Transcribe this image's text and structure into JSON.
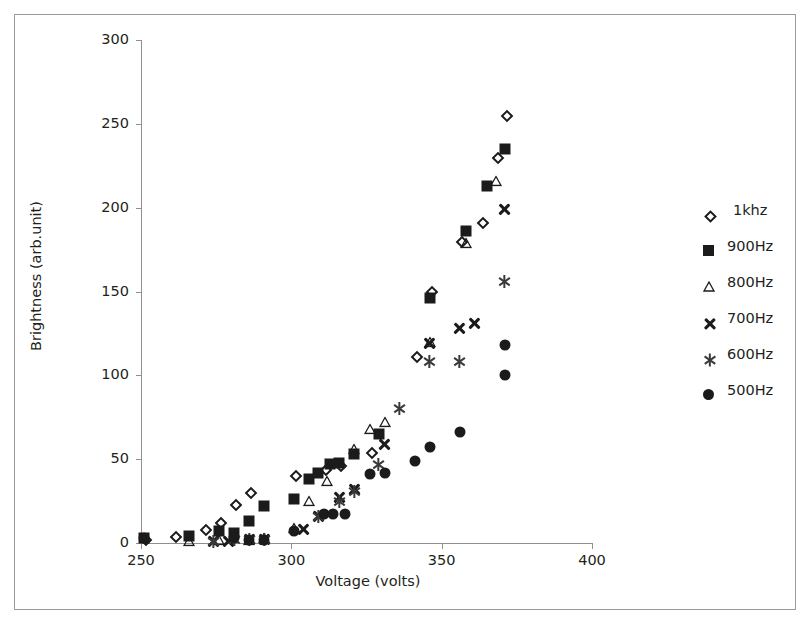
{
  "chart_data": {
    "type": "scatter",
    "title": "",
    "xlabel": "Voltage (volts)",
    "ylabel": "Brightness (arb.unit)",
    "xlim": [
      250,
      400
    ],
    "ylim": [
      0,
      300
    ],
    "xticks": [
      250,
      300,
      350,
      400
    ],
    "yticks": [
      0,
      50,
      100,
      150,
      200,
      250,
      300
    ],
    "grid": false,
    "legend_position": "right",
    "series": [
      {
        "name": "1khz",
        "marker": "open-diamond",
        "color": "#1b1b1b",
        "points": [
          [
            251,
            3
          ],
          [
            261,
            5
          ],
          [
            271,
            9
          ],
          [
            276,
            13
          ],
          [
            281,
            24
          ],
          [
            286,
            31
          ],
          [
            301,
            41
          ],
          [
            311,
            45
          ],
          [
            316,
            47
          ],
          [
            326,
            55
          ],
          [
            341,
            112
          ],
          [
            346,
            151
          ],
          [
            356,
            181
          ],
          [
            363,
            192
          ],
          [
            368,
            231
          ],
          [
            371,
            256
          ]
        ]
      },
      {
        "name": "900Hz",
        "marker": "filled-square",
        "color": "#1b1b1b",
        "points": [
          [
            251,
            3
          ],
          [
            266,
            4
          ],
          [
            276,
            7
          ],
          [
            281,
            6
          ],
          [
            286,
            13
          ],
          [
            291,
            22
          ],
          [
            301,
            26
          ],
          [
            306,
            38
          ],
          [
            309,
            42
          ],
          [
            313,
            47
          ],
          [
            316,
            48
          ],
          [
            321,
            53
          ],
          [
            329,
            65
          ],
          [
            346,
            146
          ],
          [
            358,
            186
          ],
          [
            365,
            213
          ],
          [
            371,
            235
          ]
        ]
      },
      {
        "name": "800Hz",
        "marker": "open-triangle",
        "color": "#1b1b1b",
        "points": [
          [
            266,
            1
          ],
          [
            276,
            2
          ],
          [
            286,
            2
          ],
          [
            291,
            3
          ],
          [
            301,
            9
          ],
          [
            306,
            25
          ],
          [
            312,
            37
          ],
          [
            321,
            56
          ],
          [
            326,
            68
          ],
          [
            331,
            72
          ],
          [
            346,
            120
          ],
          [
            358,
            179
          ],
          [
            368,
            216
          ]
        ]
      },
      {
        "name": "700Hz",
        "marker": "bold-x",
        "color": "#1b1b1b",
        "points": [
          [
            274,
            1
          ],
          [
            279,
            1
          ],
          [
            286,
            2
          ],
          [
            291,
            2
          ],
          [
            304,
            8
          ],
          [
            309,
            16
          ],
          [
            316,
            27
          ],
          [
            321,
            32
          ],
          [
            331,
            59
          ],
          [
            346,
            119
          ],
          [
            356,
            128
          ],
          [
            361,
            131
          ],
          [
            371,
            199
          ]
        ]
      },
      {
        "name": "600Hz",
        "marker": "asterisk",
        "color": "#3a3a3a",
        "points": [
          [
            274,
            1
          ],
          [
            281,
            2
          ],
          [
            286,
            2
          ],
          [
            291,
            2
          ],
          [
            309,
            16
          ],
          [
            316,
            25
          ],
          [
            321,
            31
          ],
          [
            329,
            47
          ],
          [
            336,
            80
          ],
          [
            346,
            108
          ],
          [
            356,
            108
          ],
          [
            371,
            156
          ]
        ]
      },
      {
        "name": "500Hz",
        "marker": "filled-circle",
        "color": "#1b1b1b",
        "points": [
          [
            251,
            3
          ],
          [
            281,
            3
          ],
          [
            286,
            2
          ],
          [
            291,
            2
          ],
          [
            301,
            7
          ],
          [
            311,
            17
          ],
          [
            314,
            17
          ],
          [
            318,
            17
          ],
          [
            326,
            41
          ],
          [
            331,
            42
          ],
          [
            341,
            49
          ],
          [
            346,
            57
          ],
          [
            356,
            66
          ],
          [
            371,
            100
          ],
          [
            371,
            118
          ]
        ]
      }
    ]
  },
  "axis": {
    "y_tick_labels": [
      "300",
      "250",
      "200",
      "150",
      "100",
      "50",
      "0"
    ],
    "x_tick_labels": [
      "250",
      "300",
      "350",
      "400"
    ],
    "x_title": "Voltage (volts)",
    "y_title": "Brightness (arb.unit)"
  },
  "legend": {
    "items": [
      {
        "label": "1khz",
        "marker": "open-diamond"
      },
      {
        "label": "900Hz",
        "marker": "filled-square"
      },
      {
        "label": "800Hz",
        "marker": "open-triangle"
      },
      {
        "label": "700Hz",
        "marker": "bold-x"
      },
      {
        "label": "600Hz",
        "marker": "asterisk"
      },
      {
        "label": "500Hz",
        "marker": "filled-circle"
      }
    ]
  }
}
